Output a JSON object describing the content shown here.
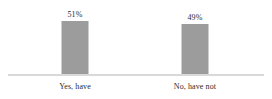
{
  "chart_data": {
    "type": "bar",
    "title": "",
    "subtitle": "",
    "xlabel": "",
    "ylabel": "",
    "categories": [
      "Yes, have",
      "No, have not"
    ],
    "values": [
      51,
      49
    ],
    "value_labels": [
      "51%",
      "49%"
    ],
    "ylim": [
      0,
      60
    ],
    "grid": false,
    "legend": false,
    "legend_position": "none",
    "bar_color": "#9c9c9c",
    "axis_color": "#d9d9d9",
    "background_color": "#ffffff",
    "text_color": "#2b2b2b"
  }
}
